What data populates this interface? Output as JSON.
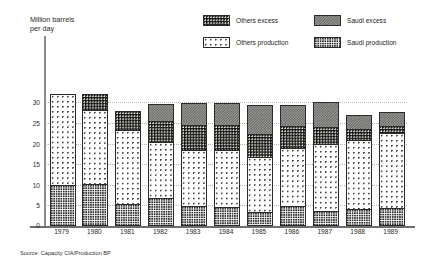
{
  "axis_caption": "Million barrels\nper day",
  "source_note": "Source: Capacity CIA/Production BP",
  "legend": {
    "items": [
      {
        "label": "Others excess",
        "key": "others_excess",
        "pattern": "black-with-white-dots",
        "color": "#14140f"
      },
      {
        "label": "Saudi excess",
        "key": "saudi_excess",
        "pattern": "grey-checker",
        "color": "#9a9a96"
      },
      {
        "label": "Others production",
        "key": "others_production",
        "pattern": "white-sparse-dots",
        "color": "#ffffff"
      },
      {
        "label": "Saudi production",
        "key": "saudi_production",
        "pattern": "light-dense-dots",
        "color": "#f2f2f0"
      }
    ]
  },
  "chart_data": {
    "type": "bar",
    "stacked": true,
    "title": "",
    "xlabel": "",
    "ylabel": "Million barrels per day",
    "ylim": [
      0,
      32.5
    ],
    "yticks": [
      0,
      5,
      10,
      15,
      20,
      25,
      30
    ],
    "grid": true,
    "legend_position": "top-right",
    "categories": [
      "1979",
      "1980",
      "1981",
      "1982",
      "1983",
      "1984",
      "1985",
      "1986",
      "1987",
      "1988",
      "1989"
    ],
    "series": [
      {
        "name": "Saudi production",
        "values": [
          9.7,
          10.0,
          5.1,
          6.6,
          4.7,
          4.3,
          3.1,
          4.6,
          3.3,
          3.9,
          4.2
        ]
      },
      {
        "name": "Others production",
        "values": [
          21.8,
          17.8,
          18.0,
          13.5,
          13.5,
          13.8,
          13.5,
          14.2,
          16.4,
          16.8,
          18.2
        ]
      },
      {
        "name": "Others excess",
        "values": [
          0.0,
          3.8,
          4.4,
          5.2,
          6.1,
          6.2,
          5.4,
          5.2,
          4.1,
          2.7,
          1.6
        ]
      },
      {
        "name": "Saudi excess",
        "values": [
          0.0,
          0.0,
          0.0,
          3.9,
          5.0,
          5.0,
          6.9,
          4.8,
          5.7,
          3.1,
          3.2
        ]
      }
    ],
    "totals": [
      31.5,
      31.6,
      27.5,
      29.2,
      29.3,
      29.3,
      28.9,
      28.8,
      29.5,
      26.5,
      27.2
    ]
  }
}
